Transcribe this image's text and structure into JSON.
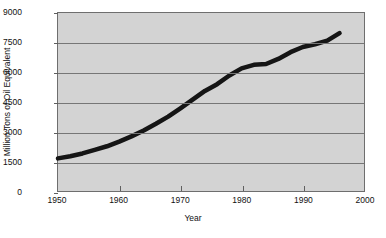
{
  "chart_data": {
    "type": "line",
    "title": "",
    "xlabel": "Year",
    "ylabel": "Million Tons of Oil Equivalent",
    "xlim": [
      1950,
      2000
    ],
    "ylim": [
      0,
      9000
    ],
    "xticks": [
      1950,
      1960,
      1970,
      1980,
      1990,
      2000
    ],
    "xtick_labels": [
      "1950",
      "1960",
      "1970",
      "1980",
      "1990",
      "2000"
    ],
    "yticks": [
      0,
      1500,
      3000,
      4500,
      6000,
      7500,
      9000
    ],
    "ytick_labels": [
      "0",
      "1500",
      "3000",
      "4500",
      "6000",
      "7500",
      "9000"
    ],
    "grid": "horizontal",
    "legend": "none",
    "series": [
      {
        "name": "World Energy Consumption",
        "color": "#151515",
        "line_width": 4,
        "x": [
          1950,
          1952,
          1954,
          1956,
          1958,
          1960,
          1962,
          1964,
          1966,
          1968,
          1970,
          1972,
          1974,
          1976,
          1978,
          1980,
          1982,
          1984,
          1986,
          1988,
          1990,
          1992,
          1994,
          1996
        ],
        "y": [
          1650,
          1760,
          1900,
          2080,
          2260,
          2500,
          2760,
          3060,
          3400,
          3760,
          4180,
          4620,
          5060,
          5400,
          5840,
          6200,
          6380,
          6420,
          6680,
          7020,
          7280,
          7420,
          7600,
          7980
        ]
      }
    ],
    "colors": {
      "plot_background": "#d3d3d3",
      "page_background": "#ffffff",
      "gridline": "#767676",
      "frame": "#6e6e6e",
      "text": "#111111",
      "series_line": "#151515"
    }
  }
}
